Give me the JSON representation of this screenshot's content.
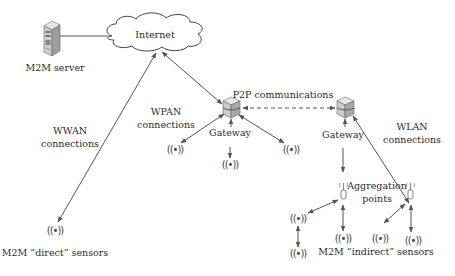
{
  "diagram": {
    "nodes": {
      "server": {
        "label": "M2M server",
        "icon": "server-tower-icon"
      },
      "internet": {
        "label": "Internet",
        "icon": "cloud-icon"
      },
      "gateway_left": {
        "label": "Gateway",
        "icon": "gateway-cube-icon"
      },
      "gateway_right": {
        "label": "Gateway",
        "icon": "gateway-cube-icon"
      },
      "aggregation": {
        "label_line1": "Aggregation",
        "label_line2": "points",
        "icon": "antenna-icon"
      }
    },
    "connections": {
      "wwan": {
        "line1": "WWAN",
        "line2": "connections"
      },
      "wpan": {
        "line1": "WPAN",
        "line2": "connections"
      },
      "wlan": {
        "line1": "WLAN",
        "line2": "connections"
      },
      "p2p": {
        "label": "P2P communications",
        "style": "dashed"
      }
    },
    "sensor_groups": {
      "direct": {
        "label": "M2M “direct” sensors"
      },
      "indirect": {
        "label": "M2M “indirect” sensors"
      }
    },
    "sensor_glyph": "((•))",
    "colors": {
      "line": "#555555",
      "text": "#2b2b2b",
      "cube_top": "#e4e4e4",
      "cube_side": "#bdbdbd",
      "server_body": "#cfcfcf"
    }
  }
}
